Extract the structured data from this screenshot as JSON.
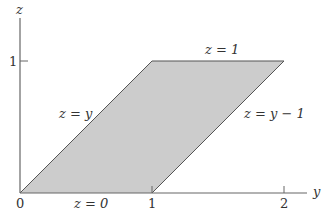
{
  "diagram": {
    "type": "region-plot",
    "axes": {
      "horizontal_label": "y",
      "vertical_label": "z",
      "horizontal_ticks": [
        "0",
        "1",
        "2"
      ],
      "vertical_ticks": [
        "1"
      ]
    },
    "region": {
      "shape": "parallelogram",
      "vertices_yz": [
        [
          0,
          0
        ],
        [
          1,
          0
        ],
        [
          2,
          1
        ],
        [
          1,
          1
        ]
      ],
      "fill_color": "#cccccc",
      "edge_color": "#555555"
    },
    "boundary_labels": {
      "top": "z = 1",
      "bottom": "z = 0",
      "left": "z = y",
      "right": "z = y − 1"
    }
  }
}
